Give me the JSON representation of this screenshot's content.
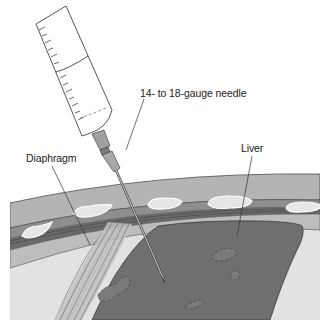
{
  "figure": {
    "type": "medical-illustration",
    "labels": {
      "needle": "14- to 18-gauge needle",
      "diaphragm": "Diaphragm",
      "liver": "Liver"
    },
    "colors": {
      "background": "#ffffff",
      "outer_wall": "#b4b4b4",
      "muscle_layer": "#9a9a9a",
      "intercostal_band": "#6e6e6e",
      "rib": "#e6e6e6",
      "pleural_space": "#c8c8c8",
      "lung_field": "#e2e2e2",
      "liver": "#6f6f6f",
      "liver_vessels": "#8a8a8a",
      "outline": "#3a3a3a",
      "syringe_barrel": "#ffffff",
      "needle_hub": "#a0a0a0"
    }
  }
}
